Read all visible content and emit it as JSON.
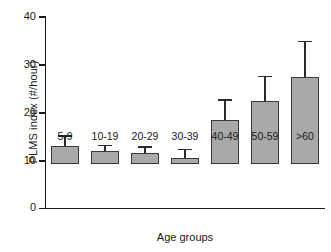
{
  "chart_data": {
    "type": "bar",
    "title": "",
    "xlabel": "Age groups",
    "ylabel": "PLMS index (#/hour)",
    "categories": [
      "5-9",
      "10-19",
      "20-29",
      "30-39",
      "40-49",
      "50-59",
      ">60"
    ],
    "values": [
      4.3,
      3.2,
      2.6,
      1.5,
      10.8,
      15.4,
      21.2
    ],
    "errors_upper": [
      6.6,
      4.3,
      3.9,
      3.3,
      15.4,
      21.2,
      29.7
    ],
    "series": [
      {
        "name": "PLMS index",
        "values": [
          4.3,
          3.2,
          2.6,
          1.5,
          10.8,
          15.4,
          21.2
        ]
      }
    ],
    "ylim": [
      0,
      40
    ],
    "yticks": [
      0,
      10,
      20,
      30,
      40
    ],
    "ytick_labels": [
      "0",
      "10",
      "20",
      "30",
      "40"
    ],
    "grid": false,
    "legend": null,
    "bar_color": "#a9a9a9",
    "edge_color": "#3a3a3a",
    "error_bar_color": "#2b2b2b",
    "error_bar_style": "upper-whisker-only"
  }
}
